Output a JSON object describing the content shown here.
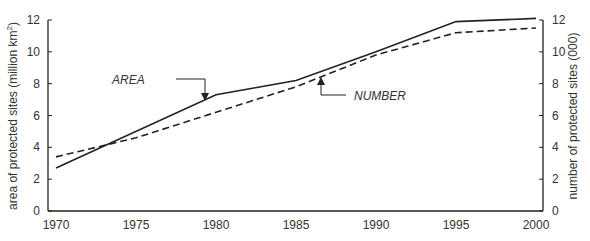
{
  "chart_data": {
    "type": "line",
    "title": "",
    "xlabel": "",
    "ylabel": "area of protected sites (million km²)",
    "ylabel_left_text": "area of protected sites (million km",
    "ylabel_left_sup": "2",
    "ylabel_left_close": ")",
    "y2label": "number of protected sites (000)",
    "x_ticks": [
      "1970",
      "1975",
      "1980",
      "1985",
      "1990",
      "1995",
      "2000"
    ],
    "y_ticks": [
      "0",
      "2",
      "4",
      "6",
      "8",
      "10",
      "12"
    ],
    "y2_ticks": [
      "0",
      "2",
      "4",
      "6",
      "8",
      "10",
      "12"
    ],
    "xlim": [
      1970,
      2000
    ],
    "ylim": [
      0,
      12
    ],
    "y2lim": [
      0,
      12
    ],
    "grid": false,
    "series": [
      {
        "name": "AREA",
        "axis": "left",
        "style": "solid",
        "x": [
          1970,
          1980,
          1985,
          1990,
          1995,
          2000
        ],
        "values": [
          2.7,
          7.3,
          8.2,
          10.0,
          11.9,
          12.1
        ]
      },
      {
        "name": "NUMBER",
        "axis": "right",
        "style": "dashed",
        "x": [
          1970,
          1975,
          1980,
          1985,
          1990,
          1995,
          2000
        ],
        "values": [
          3.4,
          4.6,
          6.2,
          7.8,
          9.8,
          11.2,
          11.5
        ]
      }
    ],
    "annotations": [
      {
        "text": "AREA",
        "points_to": "AREA line at 1980"
      },
      {
        "text": "NUMBER",
        "points_to": "NUMBER line near 1986"
      }
    ]
  }
}
